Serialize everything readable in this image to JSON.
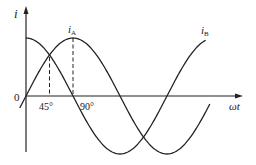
{
  "chart_data": {
    "type": "line",
    "title": "",
    "xlabel": "ωt",
    "ylabel": "i",
    "origin_label": "0",
    "x_ticks": [
      {
        "label": "45°",
        "value": 45
      },
      {
        "label": "90°",
        "value": 90
      }
    ],
    "x_unit": "degrees",
    "xlim": [
      0,
      360
    ],
    "grid": false,
    "legend": "inline curve labels",
    "series": [
      {
        "name": "i_A",
        "label_main": "i",
        "label_sub": "A",
        "formula": "sin(ωt)",
        "x": [
          0,
          45,
          90,
          135,
          180,
          225,
          270,
          315,
          360
        ],
        "values": [
          0,
          0.707,
          1,
          0.707,
          0,
          -0.707,
          -1,
          -0.707,
          0
        ]
      },
      {
        "name": "i_B",
        "label_main": "i",
        "label_sub": "B",
        "formula": "cos(ωt)",
        "x": [
          0,
          45,
          90,
          135,
          180,
          225,
          270,
          315,
          360
        ],
        "values": [
          1,
          0.707,
          0,
          -0.707,
          -1,
          -0.707,
          0,
          0.707,
          1
        ]
      }
    ],
    "annotations": [
      {
        "type": "dashed-vline",
        "x": 45,
        "note": "i_A and i_B intersect"
      },
      {
        "type": "dashed-vline",
        "x": 90,
        "note": "i_A peak"
      }
    ]
  }
}
